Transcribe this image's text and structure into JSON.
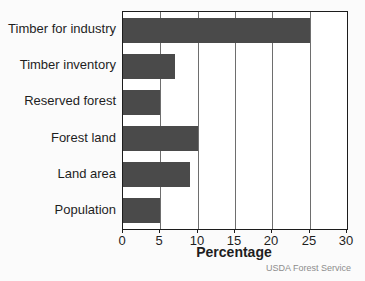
{
  "chart_data": {
    "type": "bar",
    "orientation": "horizontal",
    "categories": [
      "Timber for industry",
      "Timber inventory",
      "Reserved forest",
      "Forest land",
      "Land area",
      "Population"
    ],
    "values": [
      25,
      7,
      5,
      10,
      9,
      5
    ],
    "title": "",
    "xlabel": "Percentage",
    "ylabel": "",
    "xlim": [
      0,
      30
    ],
    "xticks": [
      0,
      5,
      10,
      15,
      20,
      25,
      30
    ],
    "grid": true,
    "legend": "none",
    "bar_color": "#4a4a4a",
    "plot_background": "#ffffff",
    "frame_color": "#1c1c1c",
    "source": "USDA Forest Service"
  }
}
